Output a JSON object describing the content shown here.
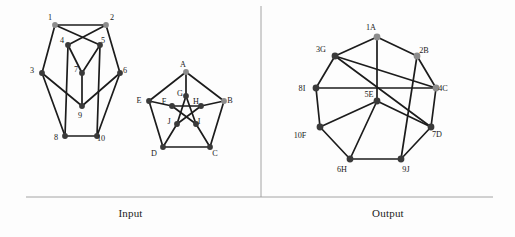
{
  "figure": {
    "width": 515,
    "height": 237,
    "background": "#fdfdfd",
    "edge_color": "#1c1c1c",
    "rule_color": "#9a9a9a",
    "node_dark_color": "#3a3a3a",
    "node_grey_color": "#8c8c8c",
    "label_color": "#1a1a1a"
  },
  "captions": {
    "input": "Input",
    "output": "Output"
  },
  "panels": {
    "input": {
      "graphs": [
        {
          "name": "left-input-graph",
          "nodes": [
            {
              "id": "1",
              "label": "1",
              "x": 55,
              "y": 25,
              "color": "#8c8c8c",
              "r": 2.9,
              "lx": 50,
              "ly": 18
            },
            {
              "id": "2",
              "label": "2",
              "x": 106,
              "y": 25,
              "color": "#8c8c8c",
              "r": 2.9,
              "lx": 112,
              "ly": 18
            },
            {
              "id": "3",
              "label": "3",
              "x": 42,
              "y": 73,
              "color": "#3a3a3a",
              "r": 2.9,
              "lx": 32,
              "ly": 71
            },
            {
              "id": "4",
              "label": "4",
              "x": 68,
              "y": 45,
              "color": "#3a3a3a",
              "r": 2.9,
              "lx": 62,
              "ly": 41
            },
            {
              "id": "5",
              "label": "5",
              "x": 100,
              "y": 45,
              "color": "#3a3a3a",
              "r": 2.9,
              "lx": 103,
              "ly": 41
            },
            {
              "id": "6",
              "label": "6",
              "x": 120,
              "y": 73,
              "color": "#3a3a3a",
              "r": 2.9,
              "lx": 125,
              "ly": 71
            },
            {
              "id": "7",
              "label": "7",
              "x": 82,
              "y": 73,
              "color": "#3a3a3a",
              "r": 2.9,
              "lx": 76,
              "ly": 70
            },
            {
              "id": "8",
              "label": "8",
              "x": 65,
              "y": 136,
              "color": "#3a3a3a",
              "r": 2.9,
              "lx": 56,
              "ly": 138
            },
            {
              "id": "9",
              "label": "9",
              "x": 82,
              "y": 106,
              "color": "#3a3a3a",
              "r": 2.9,
              "lx": 80,
              "ly": 116
            },
            {
              "id": "10",
              "label": "10",
              "x": 97,
              "y": 136,
              "color": "#3a3a3a",
              "r": 2.9,
              "lx": 101,
              "ly": 139
            }
          ],
          "edges": [
            [
              "1",
              "2"
            ],
            [
              "1",
              "3"
            ],
            [
              "1",
              "5"
            ],
            [
              "2",
              "4"
            ],
            [
              "2",
              "6"
            ],
            [
              "3",
              "8"
            ],
            [
              "3",
              "9"
            ],
            [
              "4",
              "7"
            ],
            [
              "4",
              "8"
            ],
            [
              "5",
              "7"
            ],
            [
              "5",
              "10"
            ],
            [
              "6",
              "9"
            ],
            [
              "6",
              "10"
            ],
            [
              "7",
              "9"
            ],
            [
              "8",
              "10"
            ]
          ]
        },
        {
          "name": "right-input-graph",
          "nodes": [
            {
              "id": "A",
              "label": "A",
              "x": 186,
              "y": 72,
              "color": "#8c8c8c",
              "r": 2.9,
              "lx": 183,
              "ly": 65
            },
            {
              "id": "B",
              "label": "B",
              "x": 224,
              "y": 101,
              "color": "#8c8c8c",
              "r": 2.9,
              "lx": 230,
              "ly": 101
            },
            {
              "id": "C",
              "label": "C",
              "x": 210,
              "y": 147,
              "color": "#3a3a3a",
              "r": 2.9,
              "lx": 215,
              "ly": 154
            },
            {
              "id": "D",
              "label": "D",
              "x": 163,
              "y": 147,
              "color": "#3a3a3a",
              "r": 2.9,
              "lx": 154,
              "ly": 154
            },
            {
              "id": "E",
              "label": "E",
              "x": 149,
              "y": 101,
              "color": "#3a3a3a",
              "r": 2.9,
              "lx": 139,
              "ly": 101
            },
            {
              "id": "F",
              "label": "F",
              "x": 172,
              "y": 106,
              "color": "#3a3a3a",
              "r": 2.9,
              "lx": 164,
              "ly": 102
            },
            {
              "id": "G",
              "label": "G",
              "x": 186,
              "y": 96,
              "color": "#3a3a3a",
              "r": 2.9,
              "lx": 180,
              "ly": 94
            },
            {
              "id": "H",
              "label": "H",
              "x": 201,
              "y": 106,
              "color": "#3a3a3a",
              "r": 2.9,
              "lx": 196,
              "ly": 102
            },
            {
              "id": "I",
              "label": "I",
              "x": 196,
              "y": 124,
              "color": "#3a3a3a",
              "r": 2.9,
              "lx": 199,
              "ly": 122
            },
            {
              "id": "J",
              "label": "J",
              "x": 177,
              "y": 124,
              "color": "#3a3a3a",
              "r": 2.9,
              "lx": 169,
              "ly": 122
            }
          ],
          "edges": [
            [
              "A",
              "B"
            ],
            [
              "B",
              "C"
            ],
            [
              "C",
              "D"
            ],
            [
              "D",
              "E"
            ],
            [
              "E",
              "A"
            ],
            [
              "A",
              "G"
            ],
            [
              "B",
              "H"
            ],
            [
              "C",
              "I"
            ],
            [
              "D",
              "J"
            ],
            [
              "E",
              "F"
            ],
            [
              "F",
              "H"
            ],
            [
              "H",
              "J"
            ],
            [
              "J",
              "G"
            ],
            [
              "G",
              "I"
            ],
            [
              "I",
              "F"
            ]
          ]
        }
      ]
    },
    "output": {
      "graphs": [
        {
          "name": "output-graph",
          "nodes": [
            {
              "id": "1A",
              "label": "1A",
              "x": 377,
              "y": 37,
              "color": "#8c8c8c",
              "r": 3.4,
              "lx": 371,
              "ly": 28
            },
            {
              "id": "2B",
              "label": "2B",
              "x": 417,
              "y": 56,
              "color": "#8c8c8c",
              "r": 3.4,
              "lx": 424,
              "ly": 51
            },
            {
              "id": "4C",
              "label": "4C",
              "x": 436,
              "y": 88,
              "color": "#8c8c8c",
              "r": 3.4,
              "lx": 443,
              "ly": 89
            },
            {
              "id": "7D",
              "label": "7D",
              "x": 431,
              "y": 127,
              "color": "#3a3a3a",
              "r": 3.4,
              "lx": 437,
              "ly": 135
            },
            {
              "id": "5E",
              "label": "5E",
              "x": 377,
              "y": 101,
              "color": "#3a3a3a",
              "r": 3.4,
              "lx": 369,
              "ly": 95
            },
            {
              "id": "10F",
              "label": "10F",
              "x": 320,
              "y": 127,
              "color": "#3a3a3a",
              "r": 3.4,
              "lx": 300,
              "ly": 136
            },
            {
              "id": "3G",
              "label": "3G",
              "x": 335,
              "y": 56,
              "color": "#3a3a3a",
              "r": 3.4,
              "lx": 321,
              "ly": 50
            },
            {
              "id": "6H",
              "label": "6H",
              "x": 350,
              "y": 159,
              "color": "#3a3a3a",
              "r": 3.4,
              "lx": 342,
              "ly": 170
            },
            {
              "id": "9J",
              "label": "9J",
              "x": 401,
              "y": 159,
              "color": "#3a3a3a",
              "r": 3.4,
              "lx": 406,
              "ly": 170
            },
            {
              "id": "8I",
              "label": "8I",
              "x": 316,
              "y": 88,
              "color": "#3a3a3a",
              "r": 3.4,
              "lx": 302,
              "ly": 89
            }
          ],
          "edges": [
            [
              "1A",
              "2B"
            ],
            [
              "2B",
              "4C"
            ],
            [
              "4C",
              "7D"
            ],
            [
              "7D",
              "9J"
            ],
            [
              "9J",
              "6H"
            ],
            [
              "6H",
              "10F"
            ],
            [
              "10F",
              "8I"
            ],
            [
              "8I",
              "3G"
            ],
            [
              "3G",
              "1A"
            ],
            [
              "1A",
              "5E"
            ],
            [
              "2B",
              "9J"
            ],
            [
              "4C",
              "3G"
            ],
            [
              "7D",
              "5E"
            ],
            [
              "5E",
              "6H"
            ],
            [
              "10F",
              "5E"
            ],
            [
              "8I",
              "4C"
            ],
            [
              "3G",
              "7D"
            ]
          ]
        }
      ]
    },
    "dividers": {
      "vertical": {
        "x": 261,
        "y1": 6,
        "y2": 197
      },
      "horizontal": {
        "x1": 26,
        "x2": 493,
        "y": 197
      }
    }
  }
}
